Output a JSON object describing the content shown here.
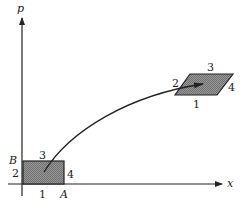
{
  "diagram": {
    "axes": {
      "vertical_label": "p",
      "horizontal_label": "x"
    },
    "initial_region": {
      "shape": "rectangle",
      "corner_labels": {
        "top_left": "B",
        "bottom_right": "A"
      },
      "edge_labels": {
        "bottom": "1",
        "left": "2",
        "top": "3",
        "right": "4"
      }
    },
    "final_region": {
      "shape": "parallelogram",
      "edge_labels": {
        "bottom": "1",
        "left": "2",
        "top": "3",
        "right": "4"
      }
    },
    "trajectory": {
      "description": "curved arrow from rectangle to parallelogram"
    },
    "colors": {
      "ink": "#222222",
      "fill": "#8a8a8a",
      "background": "#ffffff"
    }
  }
}
